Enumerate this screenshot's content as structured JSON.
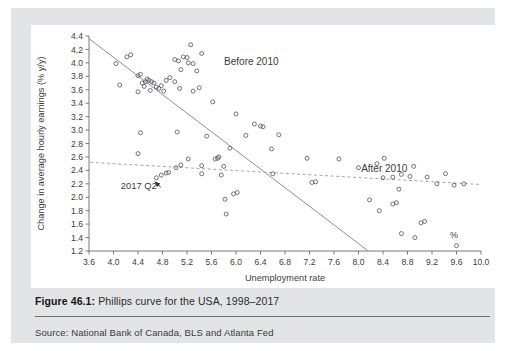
{
  "figure": {
    "number_label": "Figure 46.1:",
    "caption_text": " Phillips curve for the USA, 1998–2017",
    "source": "Source: National Bank of Canada, BLS and Atlanta Fed"
  },
  "chart_data": {
    "type": "scatter",
    "title": "",
    "xlabel": "Unemployment rate",
    "ylabel": "Change in average hourly earnings (% y/y)",
    "unit_marker": "%",
    "xlim": [
      3.6,
      10.0
    ],
    "ylim": [
      1.2,
      4.4
    ],
    "xticks": [
      "3.6",
      "4.0",
      "4.4",
      "4.8",
      "5.2",
      "5.6",
      "6.0",
      "6.4",
      "6.8",
      "7.2",
      "7.6",
      "8.0",
      "8.4",
      "8.8",
      "9.2",
      "9.6",
      "10.0"
    ],
    "yticks": [
      "1.2",
      "1.4",
      "1.6",
      "1.8",
      "2.0",
      "2.2",
      "2.4",
      "2.6",
      "2.8",
      "3.0",
      "3.2",
      "3.4",
      "3.6",
      "3.8",
      "4.0",
      "4.2",
      "4.4"
    ],
    "grid": false,
    "legend_position": "inline-annotations",
    "marker": "open-circle",
    "marker_color": "#5a5a6a",
    "annotations": [
      {
        "name": "before-2010-label",
        "text": "Before 2010",
        "x": 6.25,
        "y": 3.97
      },
      {
        "name": "after-2010-label",
        "text": "After 2010",
        "x": 8.42,
        "y": 2.38
      },
      {
        "name": "point-callout",
        "text": "2017 Q2",
        "x": 4.12,
        "y": 2.12,
        "points_to_x": 4.72,
        "points_to_y": 2.28
      }
    ],
    "trendlines": [
      {
        "name": "Before 2010",
        "style": "solid",
        "color": "#8e8e96",
        "x0": 3.6,
        "y0": 4.36,
        "x1": 8.16,
        "y1": 1.2
      },
      {
        "name": "After 2010",
        "style": "dashed",
        "color": "#9a9aa2",
        "x0": 3.62,
        "y0": 2.52,
        "x1": 10.0,
        "y1": 2.19
      }
    ],
    "series": [
      {
        "name": "Before 2010",
        "points": [
          [
            4.04,
            3.99
          ],
          [
            4.22,
            4.09
          ],
          [
            4.28,
            4.12
          ],
          [
            4.1,
            3.67
          ],
          [
            4.4,
            3.81
          ],
          [
            4.44,
            3.83
          ],
          [
            4.47,
            3.7
          ],
          [
            4.52,
            3.72
          ],
          [
            4.5,
            3.65
          ],
          [
            4.55,
            3.76
          ],
          [
            4.58,
            3.74
          ],
          [
            4.62,
            3.72
          ],
          [
            4.66,
            3.7
          ],
          [
            4.7,
            3.64
          ],
          [
            4.6,
            3.59
          ],
          [
            4.74,
            3.62
          ],
          [
            4.78,
            3.66
          ],
          [
            4.82,
            3.58
          ],
          [
            4.86,
            3.74
          ],
          [
            4.92,
            3.78
          ],
          [
            4.4,
            3.57
          ],
          [
            5.0,
            4.05
          ],
          [
            5.06,
            4.03
          ],
          [
            5.14,
            4.09
          ],
          [
            5.2,
            4.08
          ],
          [
            5.26,
            4.27
          ],
          [
            5.1,
            3.9
          ],
          [
            5.22,
            4.0
          ],
          [
            5.3,
            3.99
          ],
          [
            5.44,
            4.14
          ],
          [
            5.36,
            3.88
          ],
          [
            5.4,
            3.63
          ],
          [
            5.0,
            3.72
          ],
          [
            5.08,
            3.62
          ],
          [
            5.3,
            3.58
          ],
          [
            5.04,
            2.97
          ],
          [
            4.44,
            2.96
          ],
          [
            4.4,
            2.65
          ],
          [
            5.62,
            3.42
          ],
          [
            6.0,
            3.24
          ],
          [
            5.52,
            2.91
          ],
          [
            6.16,
            2.92
          ],
          [
            6.4,
            3.06
          ],
          [
            6.3,
            3.09
          ],
          [
            6.44,
            3.05
          ],
          [
            6.58,
            2.72
          ],
          [
            6.7,
            2.93
          ],
          [
            5.9,
            2.73
          ],
          [
            5.44,
            2.47
          ],
          [
            5.7,
            2.58
          ],
          [
            5.72,
            2.6
          ],
          [
            5.66,
            2.57
          ],
          [
            5.8,
            2.46
          ],
          [
            5.76,
            2.33
          ],
          [
            5.96,
            2.05
          ],
          [
            6.02,
            2.07
          ],
          [
            5.82,
            1.97
          ],
          [
            5.84,
            1.75
          ],
          [
            8.7,
            1.46
          ],
          [
            8.92,
            1.4
          ],
          [
            9.02,
            1.62
          ],
          [
            9.08,
            1.64
          ],
          [
            9.6,
            1.28
          ]
        ]
      },
      {
        "name": "After 2010",
        "points": [
          [
            4.7,
            2.29
          ],
          [
            4.78,
            2.33
          ],
          [
            4.86,
            2.36
          ],
          [
            4.9,
            2.37
          ],
          [
            5.02,
            2.44
          ],
          [
            5.1,
            2.48
          ],
          [
            5.22,
            2.57
          ],
          [
            5.44,
            2.35
          ],
          [
            6.6,
            2.35
          ],
          [
            7.16,
            2.58
          ],
          [
            7.24,
            2.22
          ],
          [
            7.3,
            2.23
          ],
          [
            7.68,
            2.57
          ],
          [
            8.0,
            2.44
          ],
          [
            8.3,
            2.5
          ],
          [
            8.42,
            2.58
          ],
          [
            8.4,
            2.29
          ],
          [
            8.56,
            2.3
          ],
          [
            8.7,
            2.34
          ],
          [
            8.9,
            2.46
          ],
          [
            8.84,
            2.31
          ],
          [
            9.12,
            2.3
          ],
          [
            9.28,
            2.2
          ],
          [
            8.66,
            2.12
          ],
          [
            9.42,
            2.35
          ],
          [
            9.56,
            2.18
          ],
          [
            9.72,
            2.2
          ],
          [
            8.18,
            1.96
          ],
          [
            8.56,
            1.9
          ],
          [
            8.62,
            1.92
          ],
          [
            8.34,
            1.8
          ]
        ]
      }
    ]
  }
}
